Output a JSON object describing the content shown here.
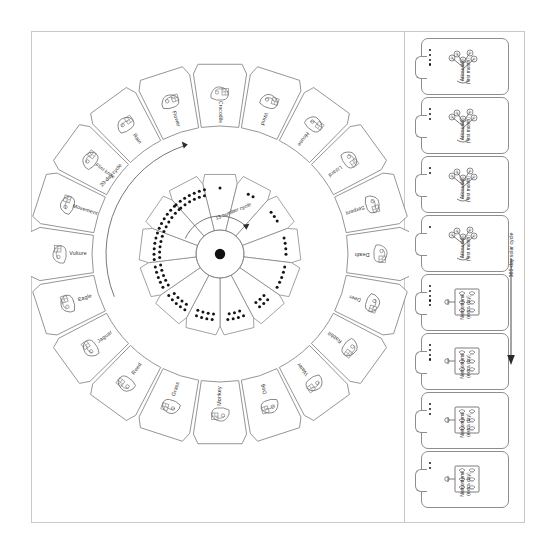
{
  "figure": {
    "outer_cycle_label": "20-day cycle",
    "inner_cycle_label": "13 number cycle",
    "solar_cycle_label": "365-day solar cycle"
  },
  "outer_ring": {
    "count": 20,
    "signs": [
      {
        "index": 1,
        "label": "Crocodile",
        "glyph": "crocodile-glyph"
      },
      {
        "index": 2,
        "label": "Wind",
        "glyph": "wind-glyph"
      },
      {
        "index": 3,
        "label": "House",
        "glyph": "house-glyph"
      },
      {
        "index": 4,
        "label": "Lizard",
        "glyph": "lizard-glyph"
      },
      {
        "index": 5,
        "label": "Serpent",
        "glyph": "serpent-glyph"
      },
      {
        "index": 6,
        "label": "Death",
        "glyph": "death-glyph"
      },
      {
        "index": 7,
        "label": "Deer",
        "glyph": "deer-glyph"
      },
      {
        "index": 8,
        "label": "Rabbit",
        "glyph": "rabbit-glyph"
      },
      {
        "index": 9,
        "label": "Water",
        "glyph": "water-glyph"
      },
      {
        "index": 10,
        "label": "Dog",
        "glyph": "dog-glyph"
      },
      {
        "index": 11,
        "label": "Monkey",
        "glyph": "monkey-glyph"
      },
      {
        "index": 12,
        "label": "Grass",
        "glyph": "grass-glyph"
      },
      {
        "index": 13,
        "label": "Reed",
        "glyph": "reed-glyph"
      },
      {
        "index": 14,
        "label": "Jaguar",
        "glyph": "jaguar-glyph"
      },
      {
        "index": 15,
        "label": "Eagle",
        "glyph": "eagle-glyph"
      },
      {
        "index": 16,
        "label": "Vulture",
        "glyph": "vulture-glyph"
      },
      {
        "index": 17,
        "label": "Movement",
        "glyph": "movement-glyph"
      },
      {
        "index": 18,
        "label": "Flint knife",
        "glyph": "flint-knife-glyph"
      },
      {
        "index": 19,
        "label": "Rain",
        "glyph": "rain-glyph"
      },
      {
        "index": 20,
        "label": "Flower",
        "glyph": "flower-glyph"
      }
    ]
  },
  "inner_ring": {
    "count": 13,
    "numbers": [
      1,
      2,
      3,
      4,
      5,
      6,
      7,
      8,
      9,
      10,
      11,
      12,
      13
    ]
  },
  "cards": [
    {
      "index": 1,
      "name": "Atlcaualo",
      "sub": "(first month)",
      "dots": 4,
      "glyph": "tree-glyph"
    },
    {
      "index": 2,
      "name": "Atlcaualo",
      "sub": "(first month)",
      "dots": 3,
      "glyph": "tree-glyph"
    },
    {
      "index": 3,
      "name": "Atlcaualo",
      "sub": "(first month)",
      "dots": 2,
      "glyph": "tree-glyph"
    },
    {
      "index": 4,
      "name": "Atlcaualo",
      "sub": "(first month)",
      "dots": 1,
      "glyph": "tree-glyph"
    },
    {
      "index": 5,
      "name": "Nemontemi",
      "sub": "(extra day)",
      "dots": 5,
      "glyph": "bundle-glyph"
    },
    {
      "index": 6,
      "name": "Nemontemi",
      "sub": "(extra day)",
      "dots": 4,
      "glyph": "bundle-glyph"
    },
    {
      "index": 7,
      "name": "Nemontemi",
      "sub": "(extra day)",
      "dots": 3,
      "glyph": "bundle-glyph"
    },
    {
      "index": 8,
      "name": "Nemontemi",
      "sub": "(extra day)",
      "dots": 2,
      "glyph": "bundle-glyph"
    }
  ],
  "colors": {
    "ink": "#2f2f2f",
    "stroke": "#7a7a7a",
    "frame": "#c9c9c9",
    "dot": "#141414",
    "paper": "#ffffff"
  }
}
